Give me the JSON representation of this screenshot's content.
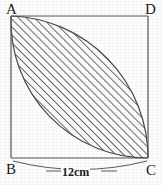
{
  "figure": {
    "kind": "geometry-diagram",
    "background_color": "#fdfdfd",
    "line_color": "#555555",
    "hatch_color": "#3a3a3a",
    "label_color": "#1b1b1b"
  },
  "square": {
    "left": 11,
    "top": 16,
    "right": 148,
    "bottom": 158,
    "stroke_width": 1.2
  },
  "vertices": [
    {
      "id": "A",
      "label": "A",
      "position": "top-left"
    },
    {
      "id": "D",
      "label": "D",
      "position": "top-right"
    },
    {
      "id": "B",
      "label": "B",
      "position": "bottom-left"
    },
    {
      "id": "C",
      "label": "C",
      "position": "bottom-right"
    }
  ],
  "arcs": [
    {
      "id": "arc-centered-at-B",
      "center": "B",
      "from": "A",
      "to": "C",
      "sweep": "bulges-toward-D"
    },
    {
      "id": "arc-centered-at-D",
      "center": "D",
      "from": "A",
      "to": "C",
      "sweep": "bulges-toward-B"
    }
  ],
  "shaded_region": {
    "name": "lens",
    "fill": "diagonal-hatch",
    "hatch_angle_deg": 45,
    "hatch_spacing_px": 4,
    "hatch_line_width": 1
  },
  "dimension": {
    "label": "12cm",
    "value": 12,
    "unit": "cm",
    "measures": "BC",
    "placement": "below-bottom-edge"
  }
}
